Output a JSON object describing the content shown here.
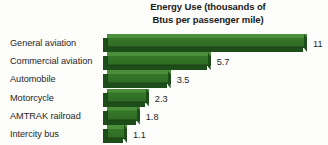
{
  "chart_data": {
    "type": "bar",
    "orientation": "horizontal",
    "title": "Energy Use (thousands of Btus per passenger mile)",
    "title_lines": [
      "Energy Use (thousands of",
      "Btus per passenger mile)"
    ],
    "xlabel": "",
    "ylabel": "",
    "xlim": [
      0,
      11
    ],
    "grid": false,
    "legend": "none",
    "style": "3d-extruded-bars",
    "bar_color": "#35762c",
    "bar_top_color": "#4b8f3b",
    "bar_shadow_color": "#1d4d18",
    "background_color": "#fdfdfb",
    "text_color": "#262626",
    "categories": [
      "General aviation",
      "Commercial aviation",
      "Automobile",
      "Motorcycle",
      "AMTRAK railroad",
      "Intercity bus"
    ],
    "values": [
      11,
      5.7,
      3.5,
      2.3,
      1.8,
      1.1
    ],
    "value_labels": [
      "11",
      "5.7",
      "3.5",
      "2.3",
      "1.8",
      "1.1"
    ],
    "bars": [
      {
        "category": "General aviation",
        "value": 11,
        "label": "11"
      },
      {
        "category": "Commercial aviation",
        "value": 5.7,
        "label": "5.7"
      },
      {
        "category": "Automobile",
        "value": 3.5,
        "label": "3.5"
      },
      {
        "category": "Motorcycle",
        "value": 2.3,
        "label": "2.3"
      },
      {
        "category": "AMTRAK railroad",
        "value": 1.8,
        "label": "1.8"
      },
      {
        "category": "Intercity bus",
        "value": 1.1,
        "label": "1.1"
      }
    ]
  }
}
